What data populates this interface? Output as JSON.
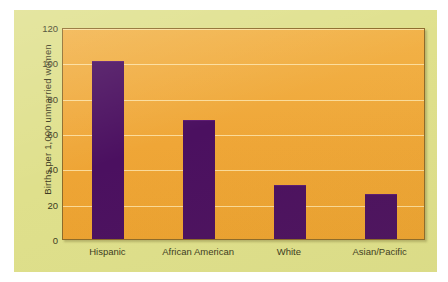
{
  "chart_data": {
    "type": "bar",
    "title": "",
    "subtitle": "",
    "xlabel": "",
    "ylabel": "Births per 1,000 unmarried women",
    "categories": [
      "Hispanic",
      "African American",
      "White",
      "Asian/Pacific"
    ],
    "values": [
      100,
      67,
      30,
      25
    ],
    "ylim": [
      0,
      120
    ],
    "yticks": [
      0,
      20,
      40,
      60,
      80,
      100,
      120
    ],
    "ytick_labels": [
      "0",
      "20",
      "40",
      "60",
      "80",
      "100",
      "120"
    ],
    "grid": "horizontal",
    "legend": "none",
    "annotations": [],
    "colors": {
      "bar": "#4B1060",
      "plot_background": "#EFA637",
      "card_background": "#DFE08C",
      "gridline": "#FFECB9",
      "text": "#3C3B22",
      "page_background": "#FFFFFF"
    }
  }
}
